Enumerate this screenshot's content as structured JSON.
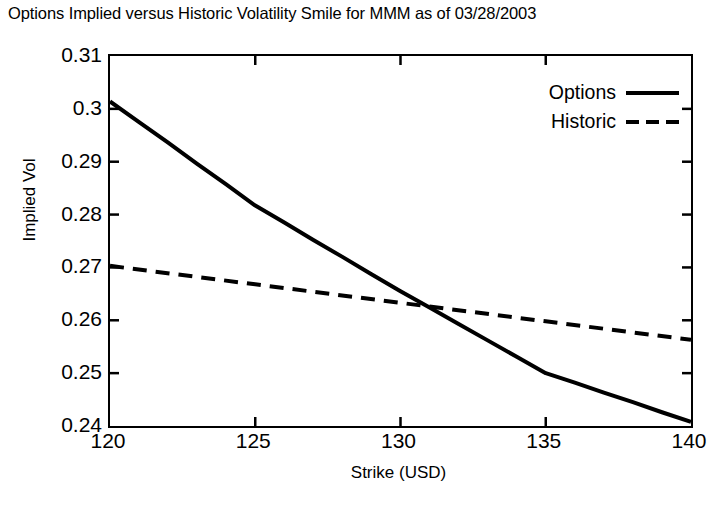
{
  "chart_data": {
    "type": "line",
    "title": "Options Implied versus Historic Volatility Smile for MMM as of 03/28/2003",
    "xlabel": "Strike (USD)",
    "ylabel": "Implied Vol",
    "xlim": [
      120,
      140
    ],
    "ylim": [
      0.24,
      0.31
    ],
    "xticks": [
      "120",
      "125",
      "130",
      "135",
      "140"
    ],
    "xtick_values": [
      120,
      125,
      130,
      135,
      140
    ],
    "yticks": [
      "0.24",
      "0.25",
      "0.26",
      "0.27",
      "0.28",
      "0.29",
      "0.3",
      "0.31"
    ],
    "ytick_values": [
      0.24,
      0.25,
      0.26,
      0.27,
      0.28,
      0.29,
      0.3,
      0.31
    ],
    "grid": false,
    "legend_position": "top-right",
    "series": [
      {
        "name": "Options",
        "style": "solid",
        "color": "#000000",
        "x": [
          120,
          121,
          122,
          123,
          124,
          125,
          126,
          127,
          128,
          129,
          130,
          131,
          132,
          133,
          134,
          135,
          136,
          137,
          138,
          139,
          140
        ],
        "values": [
          0.3014,
          0.2975,
          0.2936,
          0.2896,
          0.2857,
          0.2817,
          0.2785,
          0.2752,
          0.272,
          0.2687,
          0.2655,
          0.2624,
          0.2593,
          0.2562,
          0.2531,
          0.25,
          0.2482,
          0.2463,
          0.2445,
          0.2426,
          0.2408
        ]
      },
      {
        "name": "Historic",
        "style": "dashed",
        "color": "#000000",
        "x": [
          120,
          125,
          130,
          135,
          140
        ],
        "values": [
          0.2703,
          0.2668,
          0.2633,
          0.2598,
          0.2563
        ]
      }
    ],
    "annotations": {
      "crossover_strike": 131.6,
      "crossover_value": 0.2605
    }
  },
  "legend": {
    "items": [
      {
        "label": "Options",
        "style": "solid"
      },
      {
        "label": "Historic",
        "style": "dashed"
      }
    ]
  },
  "colors": {
    "line": "#000000",
    "axis": "#000000",
    "background": "#ffffff"
  }
}
